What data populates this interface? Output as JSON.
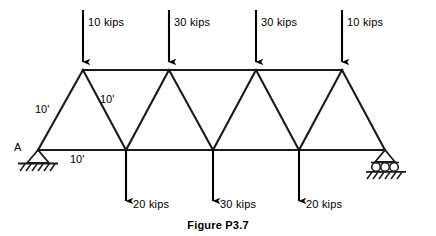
{
  "figure": {
    "caption": "Figure P3.7",
    "joint_label_a": "A"
  },
  "colors": {
    "member": "#1a1a1a",
    "load": "#000000",
    "background": "#ffffff",
    "text": "#000000"
  },
  "top_loads": [
    {
      "name": "top-load-1",
      "label": "10 kips",
      "magnitude": 10,
      "unit": "kips",
      "x": 83,
      "label_x": 88,
      "label_y": 16
    },
    {
      "name": "top-load-2",
      "label": "30 kips",
      "magnitude": 30,
      "unit": "kips",
      "x": 169,
      "label_x": 174,
      "label_y": 16
    },
    {
      "name": "top-load-3",
      "label": "30 kips",
      "magnitude": 30,
      "unit": "kips",
      "x": 256,
      "label_x": 261,
      "label_y": 16
    },
    {
      "name": "top-load-4",
      "label": "10 kips",
      "magnitude": 10,
      "unit": "kips",
      "x": 342,
      "label_x": 347,
      "label_y": 16
    }
  ],
  "bottom_loads": [
    {
      "name": "bottom-load-1",
      "label": "20 kips",
      "magnitude": 20,
      "unit": "kips",
      "x": 126,
      "label_x": 133,
      "label_y": 198
    },
    {
      "name": "bottom-load-2",
      "label": "30 kips",
      "magnitude": 30,
      "unit": "kips",
      "x": 213,
      "label_x": 220,
      "label_y": 198
    },
    {
      "name": "bottom-load-3",
      "label": "20 kips",
      "magnitude": 20,
      "unit": "kips",
      "x": 299,
      "label_x": 306,
      "label_y": 198
    }
  ],
  "dimensions": [
    {
      "name": "dim-left-diagonal",
      "label": "10'",
      "x": 35,
      "y": 103
    },
    {
      "name": "dim-second-diagonal",
      "label": "10'",
      "x": 100,
      "y": 93
    },
    {
      "name": "dim-bottom-chord",
      "label": "10'",
      "x": 70,
      "y": 153
    }
  ],
  "geometry": {
    "top_chord_y": 70,
    "bottom_chord_y": 150,
    "bottom_nodes_x": [
      38,
      126,
      213,
      299,
      385
    ],
    "top_nodes_x": [
      83,
      169,
      256,
      342
    ]
  },
  "supports": {
    "pin": {
      "name": "pin-support",
      "x": 38,
      "y": 150,
      "type": "pin"
    },
    "roller": {
      "name": "roller-support",
      "x": 385,
      "y": 150,
      "type": "roller",
      "roller_count": 3
    }
  }
}
